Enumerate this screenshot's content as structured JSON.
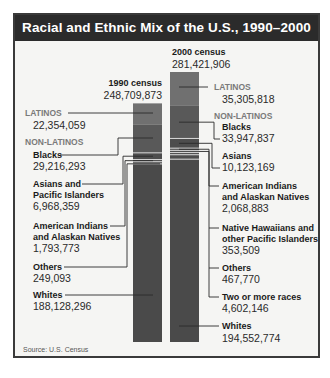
{
  "chart_data": {
    "type": "bar",
    "subtype": "stacked",
    "title": "Racial and Ethnic Mix of the U.S., 1990–2000",
    "source": "Source: U.S. Census",
    "colors": {
      "latinos": "#707070",
      "blacks": "#595959",
      "other_nonlatino": "#4d4d4d",
      "whites": "#4a4a4a",
      "separator": "#d8d8d8",
      "leader": "#2a2a2a",
      "category_label": "#7a7a7a"
    },
    "bars": [
      {
        "name": "1990 census",
        "total": 248709873,
        "total_label": "248,709,873",
        "segments": [
          {
            "group": "LATINOS",
            "label": "",
            "value": 22354059,
            "value_label": "22,354,059",
            "color_key": "latinos"
          },
          {
            "group": "NON-LATINOS",
            "label": "Blacks",
            "value": 29216293,
            "value_label": "29,216,293",
            "color_key": "blacks"
          },
          {
            "group": "NON-LATINOS",
            "label": "Asians and Pacific Islanders",
            "value": 6968359,
            "value_label": "6,968,359",
            "color_key": "other_nonlatino"
          },
          {
            "group": "NON-LATINOS",
            "label": "American Indians and Alaskan Natives",
            "value": 1793773,
            "value_label": "1,793,773",
            "color_key": "other_nonlatino"
          },
          {
            "group": "NON-LATINOS",
            "label": "Others",
            "value": 249093,
            "value_label": "249,093",
            "color_key": "other_nonlatino"
          },
          {
            "group": "NON-LATINOS",
            "label": "Whites",
            "value": 188128296,
            "value_label": "188,128,296",
            "color_key": "whites"
          }
        ]
      },
      {
        "name": "2000 census",
        "total": 281421906,
        "total_label": "281,421,906",
        "segments": [
          {
            "group": "LATINOS",
            "label": "",
            "value": 35305818,
            "value_label": "35,305,818",
            "color_key": "latinos"
          },
          {
            "group": "NON-LATINOS",
            "label": "Blacks",
            "value": 33947837,
            "value_label": "33,947,837",
            "color_key": "blacks"
          },
          {
            "group": "NON-LATINOS",
            "label": "Asians",
            "value": 10123169,
            "value_label": "10,123,169",
            "color_key": "other_nonlatino"
          },
          {
            "group": "NON-LATINOS",
            "label": "American Indians and Alaskan Natives",
            "value": 2068883,
            "value_label": "2,068,883",
            "color_key": "other_nonlatino"
          },
          {
            "group": "NON-LATINOS",
            "label": "Native Hawaiians and other Pacific Islanders",
            "value": 353509,
            "value_label": "353,509",
            "color_key": "other_nonlatino"
          },
          {
            "group": "NON-LATINOS",
            "label": "Others",
            "value": 467770,
            "value_label": "467,770",
            "color_key": "other_nonlatino"
          },
          {
            "group": "NON-LATINOS",
            "label": "Two or more races",
            "value": 4602146,
            "value_label": "4,602,146",
            "color_key": "other_nonlatino"
          },
          {
            "group": "NON-LATINOS",
            "label": "Whites",
            "value": 194552774,
            "value_label": "194,552,774",
            "color_key": "whites"
          }
        ]
      }
    ],
    "labels_1990": {
      "latinos_cat": "LATINOS",
      "latinos_val": "22,354,059",
      "nonlatinos_cat": "NON-LATINOS",
      "blacks": "Blacks",
      "blacks_val": "29,216,293",
      "asians_1": "Asians and",
      "asians_2": "Pacific Islanders",
      "asians_val": "6,968,359",
      "amind_1": "American Indians",
      "amind_2": "and Alaskan Natives",
      "amind_val": "1,793,773",
      "others": "Others",
      "others_val": "249,093",
      "whites": "Whites",
      "whites_val": "188,128,296"
    },
    "labels_2000": {
      "latinos_cat": "LATINOS",
      "latinos_val": "35,305,818",
      "nonlatinos_cat": "NON-LATINOS",
      "blacks": "Blacks",
      "blacks_val": "33,947,837",
      "asians": "Asians",
      "asians_val": "10,123,169",
      "amind_1": "American Indians",
      "amind_2": "and Alaskan Natives",
      "amind_val": "2,068,883",
      "nh_1": "Native Hawaiians and",
      "nh_2": "other Pacific Islanders",
      "nh_val": "353,509",
      "others": "Others",
      "others_val": "467,770",
      "two": "Two or more races",
      "two_val": "4,602,146",
      "whites": "Whites",
      "whites_val": "194,552,774"
    }
  }
}
